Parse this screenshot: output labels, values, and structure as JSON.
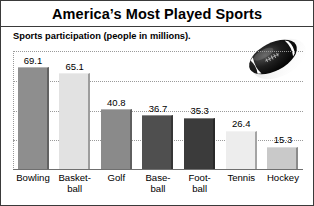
{
  "header": {
    "title": "America’s Most Played Sports",
    "subtitle": "Sports participation (people in millions)."
  },
  "decoration": {
    "ball_icon": "american-football-icon"
  },
  "colors": {
    "frame": "#3a3a3a",
    "gridline": "#9a9a9a",
    "axis": "#6f6f6f",
    "background": "#ffffff",
    "bar_bowling": "#8e8e8e",
    "bar_basketball": "#e2e2e2",
    "bar_golf": "#8a8a8a",
    "bar_baseball": "#4f4f4f",
    "bar_football": "#3b3b3b",
    "bar_tennis": "#ededed",
    "bar_hockey": "#c9c9c9"
  },
  "chart_data": {
    "type": "bar",
    "title": "America’s Most Played Sports",
    "subtitle": "Sports participation (people in millions).",
    "xlabel": "",
    "ylabel": "People in millions",
    "ylim": [
      0,
      80
    ],
    "grid": true,
    "gridlines": [
      20,
      40,
      60,
      80
    ],
    "legend": "none",
    "categories": [
      "Bowling",
      "Basket-ball",
      "Golf",
      "Base-ball",
      "Foot-ball",
      "Tennis",
      "Hockey"
    ],
    "values": [
      69.1,
      65.1,
      40.8,
      36.7,
      35.3,
      26.4,
      15.3
    ],
    "bars": [
      {
        "label_line1": "Bowling",
        "label_line2": "",
        "value": 69.1,
        "value_text": "69.1",
        "color": "#8e8e8e"
      },
      {
        "label_line1": "Basket-",
        "label_line2": "ball",
        "value": 65.1,
        "value_text": "65.1",
        "color": "#e2e2e2"
      },
      {
        "label_line1": "Golf",
        "label_line2": "",
        "value": 40.8,
        "value_text": "40.8",
        "color": "#8a8a8a"
      },
      {
        "label_line1": "Base-",
        "label_line2": "ball",
        "value": 36.7,
        "value_text": "36.7",
        "color": "#4f4f4f"
      },
      {
        "label_line1": "Foot-",
        "label_line2": "ball",
        "value": 35.3,
        "value_text": "35.3",
        "color": "#3b3b3b"
      },
      {
        "label_line1": "Tennis",
        "label_line2": "",
        "value": 26.4,
        "value_text": "26.4",
        "color": "#ededed"
      },
      {
        "label_line1": "Hockey",
        "label_line2": "",
        "value": 15.3,
        "value_text": "15.3",
        "color": "#c9c9c9"
      }
    ]
  }
}
